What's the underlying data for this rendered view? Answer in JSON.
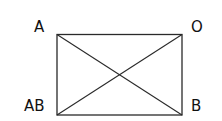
{
  "diagram": {
    "type": "rectangle-with-diagonals",
    "labels": {
      "top_left": "A",
      "top_right": "O",
      "bottom_left": "AB",
      "bottom_right": "B"
    },
    "colors": {
      "stroke": "#2a2a2a",
      "text": "#111111",
      "background": "#ffffff"
    }
  }
}
